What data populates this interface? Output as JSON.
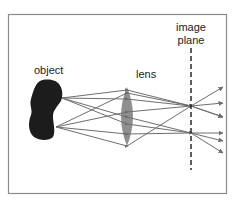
{
  "diagram": {
    "labels": {
      "object": "object",
      "lens": "lens",
      "image_plane_line1": "image",
      "image_plane_line2": "plane"
    },
    "colors": {
      "frame": "#8a8a8a",
      "object": "#1c1c1c",
      "lens": "#8f8f8f",
      "rays": "#6e6e6e",
      "image_plane": "#1a1a1a",
      "text": "#222222"
    },
    "elements": [
      {
        "id": "object",
        "type": "blob",
        "label": "object"
      },
      {
        "id": "lens",
        "type": "convex-lens",
        "label": "lens"
      },
      {
        "id": "image_plane",
        "type": "dashed-line",
        "label": "image plane"
      }
    ],
    "rays": {
      "from_top_of_object": 3,
      "from_bottom_of_object": 3,
      "converge_points": [
        "upper focus on image plane",
        "lower focus on image plane"
      ]
    }
  }
}
